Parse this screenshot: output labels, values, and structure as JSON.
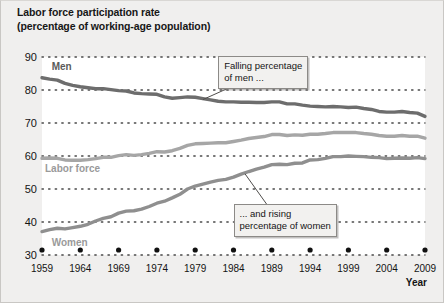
{
  "title": {
    "line1": "Labor force participation rate",
    "line2": "(percentage of working-age population)"
  },
  "axis": {
    "x_title": "Year",
    "y_ticks": [
      "90",
      "80",
      "70",
      "60",
      "50",
      "40",
      "30"
    ],
    "x_ticks": [
      "1959",
      "1964",
      "1969",
      "1974",
      "1979",
      "1984",
      "1989",
      "1994",
      "1999",
      "2004",
      "2009"
    ]
  },
  "series_labels": {
    "men": "Men",
    "labor_force": "Labor force",
    "women": "Women"
  },
  "annotations": {
    "men_note": "Falling percentage\nof men ...",
    "women_note": "... and rising\npercentage of women"
  },
  "colors": {
    "men_line": "#6d6d6d",
    "labor_force_line": "#a6a6a6",
    "women_line": "#8f8f8f",
    "men_label": "#5a5a5a",
    "labor_force_label": "#9a9a9a",
    "women_label": "#9a9a9a",
    "gridline": "#4a4a4a",
    "plot_background": "#ffffff",
    "figure_background": "#f0efee",
    "callout_background": "#f2f1ef",
    "callout_border": "#8c8a87"
  },
  "chart_data": {
    "type": "line",
    "title": "Labor force participation rate (percentage of working-age population)",
    "xlabel": "Year",
    "ylabel": "",
    "xlim": [
      1959,
      2009
    ],
    "ylim": [
      30,
      90
    ],
    "grid": true,
    "grid_style": "dotted-horizontal",
    "legend": "inline-series-labels",
    "x": [
      1959,
      1960,
      1961,
      1962,
      1963,
      1964,
      1965,
      1966,
      1967,
      1968,
      1969,
      1970,
      1971,
      1972,
      1973,
      1974,
      1975,
      1976,
      1977,
      1978,
      1979,
      1980,
      1981,
      1982,
      1983,
      1984,
      1985,
      1986,
      1987,
      1988,
      1989,
      1990,
      1991,
      1992,
      1993,
      1994,
      1995,
      1996,
      1997,
      1998,
      1999,
      2000,
      2001,
      2002,
      2003,
      2004,
      2005,
      2006,
      2007,
      2008,
      2009
    ],
    "series": [
      {
        "name": "Men",
        "color": "#6d6d6d",
        "values": [
          83.7,
          83.3,
          83.0,
          82.0,
          81.4,
          81.0,
          80.7,
          80.4,
          80.4,
          80.1,
          79.8,
          79.7,
          79.1,
          78.9,
          78.8,
          78.7,
          77.9,
          77.5,
          77.7,
          77.9,
          77.8,
          77.4,
          77.0,
          76.6,
          76.4,
          76.4,
          76.3,
          76.3,
          76.2,
          76.2,
          76.4,
          76.4,
          75.8,
          75.8,
          75.4,
          75.1,
          75.0,
          74.9,
          75.0,
          74.9,
          74.7,
          74.8,
          74.4,
          74.1,
          73.5,
          73.3,
          73.3,
          73.5,
          73.2,
          73.0,
          72.0
        ]
      },
      {
        "name": "Women",
        "color": "#8f8f8f",
        "values": [
          37.1,
          37.7,
          38.1,
          37.9,
          38.3,
          38.7,
          39.3,
          40.3,
          41.1,
          41.6,
          42.7,
          43.3,
          43.4,
          43.9,
          44.7,
          45.7,
          46.3,
          47.3,
          48.4,
          50.0,
          50.9,
          51.5,
          52.1,
          52.6,
          52.9,
          53.6,
          54.5,
          55.3,
          56.0,
          56.6,
          57.4,
          57.5,
          57.4,
          57.8,
          57.9,
          58.8,
          58.9,
          59.3,
          59.8,
          59.8,
          60.0,
          59.9,
          59.8,
          59.6,
          59.5,
          59.2,
          59.3,
          59.4,
          59.3,
          59.5,
          59.2
        ]
      },
      {
        "name": "Labor force",
        "color": "#a6a6a6",
        "values": [
          59.3,
          59.4,
          59.3,
          58.8,
          58.7,
          58.7,
          58.9,
          59.2,
          59.6,
          59.6,
          60.1,
          60.4,
          60.2,
          60.4,
          60.8,
          61.3,
          61.2,
          61.6,
          62.3,
          63.2,
          63.7,
          63.8,
          63.9,
          64.0,
          64.0,
          64.4,
          64.8,
          65.3,
          65.6,
          65.9,
          66.5,
          66.5,
          66.2,
          66.4,
          66.3,
          66.6,
          66.6,
          66.8,
          67.1,
          67.1,
          67.1,
          67.1,
          66.8,
          66.6,
          66.2,
          66.0,
          66.0,
          66.2,
          66.0,
          66.0,
          65.4
        ]
      }
    ],
    "annotations": [
      {
        "text": "Falling percentage of men ...",
        "points_to_series": "Men",
        "points_to_x": 1989
      },
      {
        "text": "... and rising percentage of women",
        "points_to_series": "Women",
        "points_to_x": 1989
      }
    ]
  }
}
